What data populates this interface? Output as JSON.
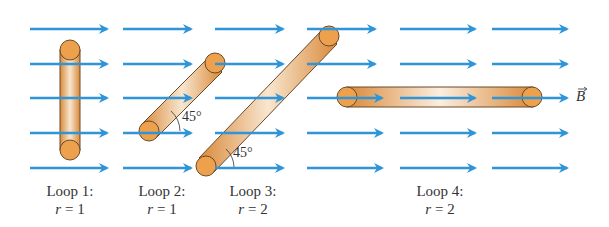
{
  "figure": {
    "field_label": "B",
    "field_color": "#2f95d8",
    "loop_color": "#e8a24a",
    "loops": [
      {
        "name": "Loop 1:",
        "r_label": "r",
        "r_value": "= 1",
        "orientation": "vertical"
      },
      {
        "name": "Loop 2:",
        "r_label": "r",
        "r_value": "= 1",
        "orientation": "45 deg",
        "angle": "45°"
      },
      {
        "name": "Loop 3:",
        "r_label": "r",
        "r_value": "= 2",
        "orientation": "45 deg",
        "angle": "45°"
      },
      {
        "name": "Loop 4:",
        "r_label": "r",
        "r_value": "= 2",
        "orientation": "horizontal"
      }
    ]
  }
}
